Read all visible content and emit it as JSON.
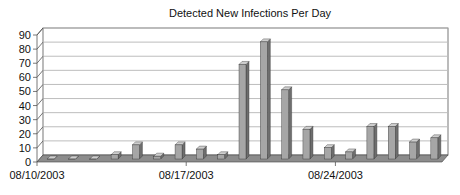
{
  "chart_data": {
    "type": "bar",
    "title": "Detected New Infections Per Day",
    "xlabel": "",
    "ylabel": "",
    "ylim": [
      0,
      90
    ],
    "yticks": [
      0,
      10,
      20,
      30,
      40,
      50,
      60,
      70,
      80,
      90
    ],
    "grid": true,
    "legend": "none",
    "style": "3d-column",
    "categories": [
      "08/10/2003",
      "08/11/2003",
      "08/12/2003",
      "08/13/2003",
      "08/14/2003",
      "08/15/2003",
      "08/16/2003",
      "08/17/2003",
      "08/18/2003",
      "08/19/2003",
      "08/20/2003",
      "08/21/2003",
      "08/22/2003",
      "08/23/2003",
      "08/24/2003",
      "08/25/2003",
      "08/26/2003",
      "08/27/2003",
      "08/28/2003"
    ],
    "x_tick_labels": [
      "08/10/2003",
      "08/17/2003",
      "08/24/2003"
    ],
    "values": [
      0,
      0,
      0,
      3,
      10,
      2,
      10,
      7,
      3,
      67,
      83,
      49,
      21,
      8,
      5,
      23,
      23,
      12,
      15
    ],
    "colors": {
      "bar_front": "#a6a6a6",
      "bar_side": "#6e6e6e",
      "bar_top": "#cfcfcf",
      "floor": "#8c8c8c",
      "grid": "#bdbdbd",
      "axis": "#555555"
    }
  }
}
